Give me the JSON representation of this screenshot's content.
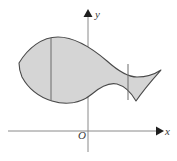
{
  "figure": {
    "kind": "math-diagram",
    "width": 177,
    "height": 161,
    "background_color": "#ffffff"
  },
  "axes": {
    "x_axis": {
      "label": "x",
      "icon": "arrow-right-icon",
      "color": "#8a8a8a",
      "y_pixel": 131,
      "x_start": 8,
      "x_end": 158
    },
    "y_axis": {
      "label": "y",
      "icon": "arrow-up-icon",
      "color": "#8a8a8a",
      "x_pixel": 88,
      "y_start": 14,
      "y_end": 152
    },
    "origin": {
      "label": "O",
      "x_pixel": 88,
      "y_pixel": 131
    }
  },
  "region": {
    "name": "shaded-region",
    "fill_color": "#d5d5d5",
    "stroke_color": "#4a4a4a",
    "stroke_width": 1.1,
    "outline_path": "M 19 63 C 30 46, 44 37, 58 37 C 76 37, 92 48, 106 60 C 116 69, 126 76, 136 76 C 146 76, 154 74, 160 71 C 152 79, 143 89, 135 100 C 130 92, 124 86, 117 84 C 108 82, 99 87, 92 93 C 80 103, 66 104, 52 101 C 40 98, 29 88, 22 76 C 20 72, 19 67, 19 63 Z",
    "chords": [
      {
        "name": "left-chord",
        "x": 51,
        "y_top": 38,
        "y_bottom": 101,
        "color": "#6a6a6a"
      },
      {
        "name": "right-chord",
        "x": 128,
        "y_top": 64,
        "y_bottom": 99,
        "color": "#6a6a6a"
      }
    ]
  }
}
